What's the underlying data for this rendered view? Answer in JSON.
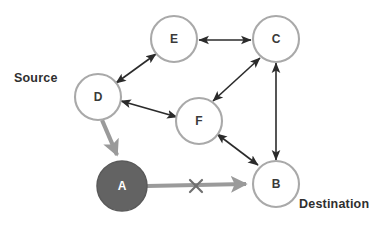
{
  "diagram": {
    "canvas": {
      "width": 387,
      "height": 226,
      "background": "#ffffff"
    },
    "colors": {
      "node_stroke": "#a9a9a9",
      "node_fill": "#ffffff",
      "source_node_fill": "#636363",
      "edge_black": "#2b2b2b",
      "edge_gray": "#9a9a9a",
      "cross_mark": "#6f6f6f",
      "label_text": "#2f2f2f",
      "node_text": "#3a3a3a",
      "node_text_on_dark": "#ffffff"
    },
    "nodes": [
      {
        "id": "E",
        "label": "E",
        "cx": 174,
        "cy": 39,
        "r": 23,
        "filled": false
      },
      {
        "id": "C",
        "label": "C",
        "cx": 276,
        "cy": 39,
        "r": 23,
        "filled": false
      },
      {
        "id": "D",
        "label": "D",
        "cx": 98,
        "cy": 97,
        "r": 23,
        "filled": false
      },
      {
        "id": "F",
        "label": "F",
        "cx": 199,
        "cy": 121,
        "r": 23,
        "filled": false
      },
      {
        "id": "B",
        "label": "B",
        "cx": 276,
        "cy": 184,
        "r": 23,
        "filled": false
      },
      {
        "id": "A",
        "label": "A",
        "cx": 122,
        "cy": 186,
        "r": 25,
        "filled": true
      }
    ],
    "edges": [
      {
        "from": "D",
        "to": "E",
        "style": "black",
        "arrows": "both"
      },
      {
        "from": "E",
        "to": "C",
        "style": "black",
        "arrows": "both"
      },
      {
        "from": "D",
        "to": "F",
        "style": "black",
        "arrows": "both"
      },
      {
        "from": "F",
        "to": "C",
        "style": "black",
        "arrows": "both"
      },
      {
        "from": "F",
        "to": "B",
        "style": "black",
        "arrows": "both"
      },
      {
        "from": "C",
        "to": "B",
        "style": "black",
        "arrows": "both"
      },
      {
        "from": "D",
        "to": "A",
        "style": "gray",
        "arrows": "end"
      },
      {
        "from": "A",
        "to": "B",
        "style": "gray",
        "arrows": "end",
        "blocked": true
      }
    ],
    "markers": [
      {
        "type": "cross",
        "label": "X",
        "x": 196,
        "y": 186,
        "on_edge": "A-B"
      }
    ],
    "annotations": {
      "source_label": "Source",
      "destination_label": "Destination"
    }
  }
}
